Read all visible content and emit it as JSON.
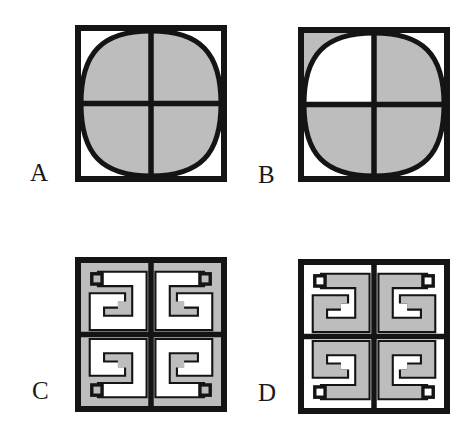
{
  "page": {
    "background_color": "#ffffff",
    "ink_color": "#141414",
    "fill_gray": "#bdbdbd",
    "fill_white": "#ffffff",
    "width": 468,
    "height": 437
  },
  "figures": [
    {
      "label": "A",
      "label_x": 30,
      "label_y": 160,
      "box_x": 75,
      "box_y": 25,
      "box_w": 152,
      "box_h": 157,
      "kind": "hyperbola-quadrants",
      "quadrants": [
        {
          "name": "top-left",
          "shaded_side": "outer",
          "curve": "concave-to-corner"
        },
        {
          "name": "top-right",
          "shaded_side": "outer",
          "curve": "concave-to-corner"
        },
        {
          "name": "bottom-left",
          "shaded_side": "outer",
          "curve": "concave-to-corner"
        },
        {
          "name": "bottom-right",
          "shaded_side": "outer",
          "curve": "concave-to-corner"
        }
      ]
    },
    {
      "label": "B",
      "label_x": 258,
      "label_y": 162,
      "box_x": 298,
      "box_y": 27,
      "box_w": 152,
      "box_h": 155,
      "kind": "hyperbola-quadrants",
      "quadrants": [
        {
          "name": "top-left",
          "shaded_side": "inner",
          "curve": "concave-to-corner"
        },
        {
          "name": "top-right",
          "shaded_side": "outer",
          "curve": "concave-to-corner"
        },
        {
          "name": "bottom-left",
          "shaded_side": "outer",
          "curve": "concave-to-corner"
        },
        {
          "name": "bottom-right",
          "shaded_side": "outer",
          "curve": "concave-to-corner"
        }
      ]
    },
    {
      "label": "C",
      "label_x": 32,
      "label_y": 378,
      "box_x": 75,
      "box_y": 257,
      "box_w": 152,
      "box_h": 155,
      "kind": "greek-key-spirals",
      "tone": "gray-ground-white-band"
    },
    {
      "label": "D",
      "label_x": 258,
      "label_y": 380,
      "box_x": 298,
      "box_y": 259,
      "box_w": 152,
      "box_h": 155,
      "kind": "greek-key-spirals",
      "tone": "white-ground-gray-band"
    }
  ]
}
